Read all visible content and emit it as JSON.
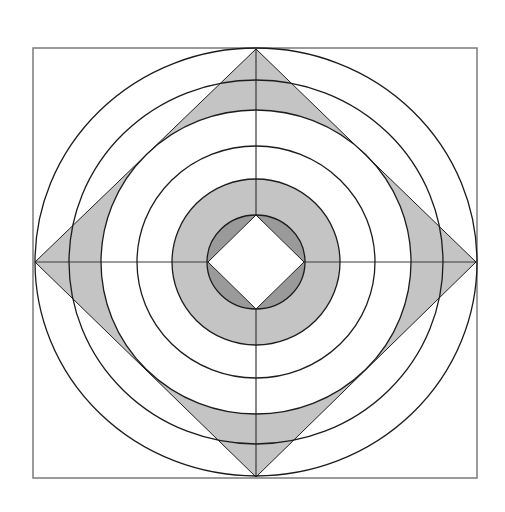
{
  "figure": {
    "width": 505,
    "height": 512,
    "center": [
      256,
      262
    ],
    "colors": {
      "background": "#ffffff",
      "stroke": "#1c1c1c",
      "frame_stroke": "#7a7a7a",
      "axis_stroke": "#3a3a3a",
      "fill_light": "#c4c4c4",
      "fill_dark": "#9a9a9a"
    },
    "frame": {
      "x": 33,
      "y": 48,
      "width": 444,
      "height": 430
    },
    "outer_diamond": {
      "points": [
        [
          256,
          49
        ],
        [
          476,
          262
        ],
        [
          256,
          477
        ],
        [
          35,
          262
        ]
      ]
    },
    "inner_diamond": {
      "points": [
        [
          256,
          215
        ],
        [
          304,
          262
        ],
        [
          256,
          309
        ],
        [
          208,
          262
        ]
      ]
    },
    "rings": [
      {
        "id": "ring-1",
        "rx": 221,
        "ry": 214
      },
      {
        "id": "ring-2",
        "rx": 187,
        "ry": 182
      },
      {
        "id": "ring-3",
        "rx": 155,
        "ry": 152
      },
      {
        "id": "ring-4",
        "rx": 119,
        "ry": 116
      },
      {
        "id": "ring-5",
        "rx": 84,
        "ry": 83
      },
      {
        "id": "ring-6",
        "rx": 49,
        "ry": 47
      }
    ],
    "axes": {
      "horizontal": {
        "x1": 35,
        "x2": 476,
        "y": 262
      },
      "vertical": {
        "x": 256,
        "y1": 49,
        "y2": 477
      }
    },
    "shaded_regions": [
      {
        "name": "outer diamond minus ring-3 disc",
        "fill": "light"
      },
      {
        "name": "annulus between ring-5 and ring-6",
        "fill": "light"
      },
      {
        "name": "ring-6 disc minus inner diamond",
        "fill": "dark"
      }
    ]
  }
}
